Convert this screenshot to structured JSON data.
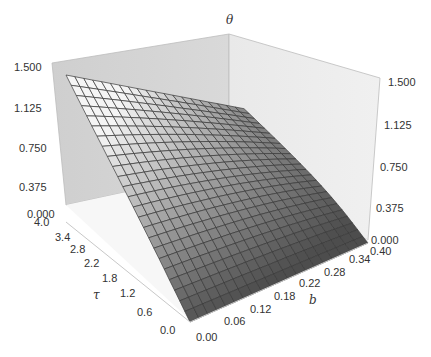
{
  "chart_data": {
    "type": "surface3d",
    "title": "",
    "axes": {
      "x": {
        "label": "b",
        "range": [
          0.0,
          0.4
        ],
        "ticks": [
          "0.00",
          "0.06",
          "0.12",
          "0.18",
          "0.22",
          "0.28",
          "0.34",
          "0.40"
        ]
      },
      "y": {
        "label": "τ",
        "range": [
          0.0,
          4.0
        ],
        "ticks": [
          "0.0",
          "0.6",
          "1.2",
          "1.8",
          "2.2",
          "2.8",
          "3.4",
          "4.0"
        ]
      },
      "z": {
        "label": "θ",
        "range": [
          0.0,
          1.5
        ],
        "ticks": [
          "0.000",
          "0.375",
          "0.750",
          "1.125",
          "1.500"
        ]
      }
    },
    "grid": false,
    "legend": null,
    "mesh": {
      "nx": 20,
      "ny": 24
    },
    "surface_description": "θ rises with τ and falls with b; θ≈1.5 at (b=0, τ=4.0), θ≈0.35 at (b=0.40, τ=4.0), θ≈0.2 at (b=0.40, τ≈0.5), θ=0 along τ=0",
    "corner_values": [
      {
        "b": 0.0,
        "tau": 0.0,
        "theta": 0.0
      },
      {
        "b": 0.4,
        "tau": 0.0,
        "theta": 0.0
      },
      {
        "b": 0.0,
        "tau": 4.0,
        "theta": 1.5
      },
      {
        "b": 0.4,
        "tau": 4.0,
        "theta": 0.35
      }
    ],
    "colors": {
      "wall": "#d4d4d4",
      "wall_light": "#e6e6e6",
      "mesh_line": "#3a3a3a",
      "surface_dark": "#555555",
      "surface_light": "#f2f2f2"
    }
  },
  "labels": {
    "z_axis": "θ",
    "y_axis": "τ",
    "x_axis": "b"
  },
  "left_z_ticks": [
    "1.500",
    "1.125",
    "0.750",
    "0.375",
    "0.000"
  ],
  "right_z_ticks": [
    "1.500",
    "1.125",
    "0.750",
    "0.375",
    "0.000"
  ],
  "tau_ticks": [
    "4.0",
    "3.4",
    "2.8",
    "2.2",
    "1.8",
    "1.2",
    "0.6",
    "0.0"
  ],
  "b_ticks": [
    "0.00",
    "0.06",
    "0.12",
    "0.18",
    "0.22",
    "0.28",
    "0.34",
    "0.40"
  ]
}
